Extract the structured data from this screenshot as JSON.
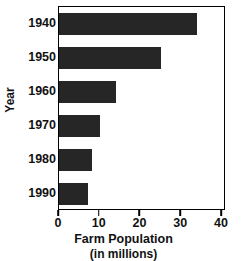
{
  "chart_data": {
    "type": "bar",
    "orientation": "horizontal",
    "title": "",
    "xlabel": "Farm Population",
    "xlabel_sub": "(in millions)",
    "ylabel": "Year",
    "categories": [
      "1940",
      "1950",
      "1960",
      "1970",
      "1980",
      "1990"
    ],
    "values": [
      34,
      25,
      14,
      10,
      8,
      7
    ],
    "xlim": [
      0,
      41
    ],
    "xticks": [
      0,
      10,
      20,
      30,
      40
    ],
    "xtick_labels": [
      "0",
      "10",
      "20",
      "30",
      "40"
    ],
    "ytick_labels": [
      "1940",
      "1950",
      "1960",
      "1970",
      "1980",
      "1990"
    ],
    "grid": false,
    "legend": null,
    "legend_position": "none",
    "bar_color": "#262626",
    "axis_color": "#000000",
    "background_color": "#ffffff",
    "series": [
      {
        "name": "Farm Population",
        "values": [
          34,
          25,
          14,
          10,
          8,
          7
        ]
      }
    ]
  }
}
